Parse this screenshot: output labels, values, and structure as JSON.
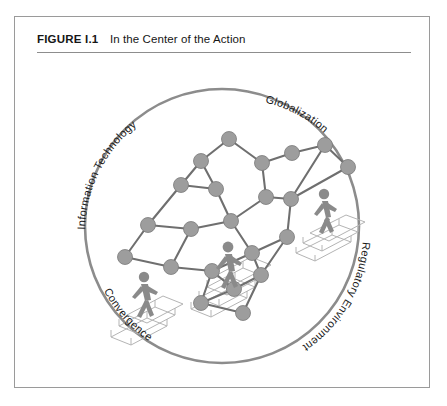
{
  "figure": {
    "label": "FIGURE I.1",
    "title": "In the Center of the Action"
  },
  "colors": {
    "circle_stroke": "#8c8c8c",
    "node_fill": "#9d9d9d",
    "edge_stroke": "#6f6f6f",
    "stair_stroke": "#b4b4b4",
    "figure_fill": "#8a8a8a",
    "label_text": "#1a1a1a",
    "frame_border": "#9a9a9a",
    "rule": "#8d8d8d",
    "page_background": "#ffffff"
  },
  "diagram": {
    "shape": "circle",
    "labels": [
      {
        "id": "information-technology",
        "text": "Information Technology",
        "position": "upper-left",
        "rotation": -62
      },
      {
        "id": "globalization",
        "text": "Globalization",
        "position": "upper-right",
        "rotation": 42
      },
      {
        "id": "regulatory-environment",
        "text": "Regulatory Environment",
        "position": "lower-right",
        "rotation": -62
      },
      {
        "id": "convergence",
        "text": "Convergence",
        "position": "lower-left",
        "rotation": 47
      }
    ],
    "walking_figures": [
      {
        "id": "figure-upper-right",
        "description": "person climbing stairs, upper right"
      },
      {
        "id": "figure-center",
        "description": "person climbing stairs, center"
      },
      {
        "id": "figure-lower-left",
        "description": "person climbing stairs, lower left"
      }
    ],
    "network": {
      "node_count": 22,
      "nodes": [
        {
          "id": "n1",
          "x": 214,
          "y": 82
        },
        {
          "id": "n2",
          "x": 186,
          "y": 104
        },
        {
          "id": "n3",
          "x": 247,
          "y": 106
        },
        {
          "id": "n4",
          "x": 277,
          "y": 96
        },
        {
          "id": "n5",
          "x": 310,
          "y": 88
        },
        {
          "id": "n6",
          "x": 333,
          "y": 110
        },
        {
          "id": "n7",
          "x": 166,
          "y": 128
        },
        {
          "id": "n8",
          "x": 201,
          "y": 132
        },
        {
          "id": "n9",
          "x": 251,
          "y": 140
        },
        {
          "id": "n10",
          "x": 276,
          "y": 142
        },
        {
          "id": "n11",
          "x": 133,
          "y": 168
        },
        {
          "id": "n12",
          "x": 176,
          "y": 172
        },
        {
          "id": "n13",
          "x": 216,
          "y": 164
        },
        {
          "id": "n14",
          "x": 272,
          "y": 180
        },
        {
          "id": "n15",
          "x": 110,
          "y": 200
        },
        {
          "id": "n16",
          "x": 156,
          "y": 210
        },
        {
          "id": "n17",
          "x": 197,
          "y": 214
        },
        {
          "id": "n18",
          "x": 237,
          "y": 196
        },
        {
          "id": "n19",
          "x": 186,
          "y": 246
        },
        {
          "id": "n20",
          "x": 219,
          "y": 232
        },
        {
          "id": "n21",
          "x": 246,
          "y": 218
        },
        {
          "id": "n22",
          "x": 228,
          "y": 256
        }
      ]
    }
  }
}
